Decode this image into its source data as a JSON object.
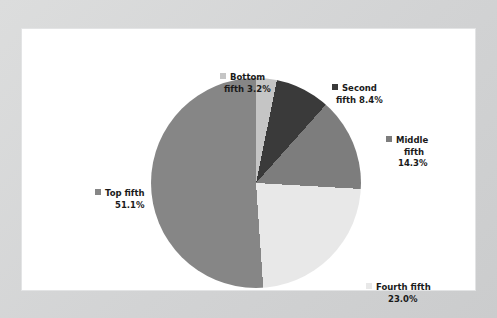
{
  "chart_data": {
    "type": "pie",
    "title": "",
    "categories": [
      "Bottom fifth",
      "Second fifth",
      "Middle fifth",
      "Fourth fifth",
      "Top fifth"
    ],
    "values": [
      3.2,
      8.4,
      14.3,
      23.0,
      51.1
    ],
    "unit": "%",
    "start_angle_deg": 0,
    "direction": "clockwise",
    "legend": "labels-around-slices",
    "grid": false,
    "slices": [
      {
        "label": "Bottom fifth",
        "value": 3.2,
        "value_text": "3.2%",
        "color": "#c5c5c5"
      },
      {
        "label": "Second fifth",
        "value": 8.4,
        "value_text": "8.4%",
        "color": "#3a3a3a"
      },
      {
        "label": "Middle fifth",
        "value": 14.3,
        "value_text": "14.3%",
        "color": "#7d7d7d"
      },
      {
        "label": "Fourth fifth",
        "value": 23.0,
        "value_text": "23.0%",
        "color": "#e8e8e8"
      },
      {
        "label": "Top fifth",
        "value": 51.1,
        "value_text": "51.1%",
        "color": "#868686"
      }
    ]
  },
  "labels": {
    "bottom": {
      "line1": "Bottom",
      "line2": "fifth 3.2%"
    },
    "second": {
      "line1": "Second",
      "line2": "fifth 8.4%"
    },
    "middle": {
      "line1": "Middle",
      "line2": "fifth",
      "line3": "14.3%"
    },
    "fourth": {
      "line1": "Fourth fifth",
      "line2": "23.0%"
    },
    "top": {
      "line1": "Top fifth",
      "line2": "51.1%"
    }
  },
  "colors": {
    "bottom": "#c5c5c5",
    "second": "#3a3a3a",
    "middle": "#7d7d7d",
    "fourth": "#e8e8e8",
    "top": "#868686",
    "panel_background": "#ffffff",
    "frame_background": "#d6d7d8",
    "text": "#1a1a1a"
  }
}
